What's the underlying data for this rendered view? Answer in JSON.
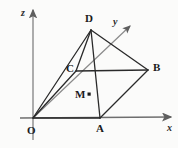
{
  "figure": {
    "kind": "3d-solid-geometry-diagram",
    "width": 178,
    "height": 148,
    "background_color": "#fbfbfa",
    "stroke_color": "#2a2a2a",
    "axis_color": "#6e6e6e"
  },
  "axes": [
    {
      "id": "x",
      "label": "x",
      "label_x": 167,
      "label_y": 124,
      "from_x": 20,
      "from_y": 118,
      "to_x": 171,
      "to_y": 117
    },
    {
      "id": "y",
      "label": "y",
      "label_x": 113,
      "label_y": 18,
      "from_x": 33,
      "from_y": 118,
      "to_x": 130,
      "to_y": 26
    },
    {
      "id": "z",
      "label": "z",
      "label_x": 21,
      "label_y": 8,
      "from_x": 33,
      "from_y": 140,
      "to_x": 33,
      "to_y": 10
    }
  ],
  "vertices": [
    {
      "id": "O",
      "label": "O",
      "x": 33,
      "y": 118,
      "label_x": 27,
      "label_y": 126
    },
    {
      "id": "A",
      "label": "A",
      "x": 100,
      "y": 118,
      "label_x": 96,
      "label_y": 124
    },
    {
      "id": "B",
      "label": "B",
      "x": 148,
      "y": 70,
      "label_x": 153,
      "label_y": 63
    },
    {
      "id": "C",
      "label": "C",
      "x": 76,
      "y": 71,
      "label_x": 67,
      "label_y": 63
    },
    {
      "id": "D",
      "label": "D",
      "x": 91,
      "y": 30,
      "label_x": 86,
      "label_y": 14
    },
    {
      "id": "M",
      "label": "M",
      "x": 89,
      "y": 95,
      "label_x": 76,
      "label_y": 90
    }
  ],
  "edges": [
    {
      "id": "OA",
      "from": "O",
      "to": "A"
    },
    {
      "id": "AB",
      "from": "A",
      "to": "B"
    },
    {
      "id": "BC",
      "from": "B",
      "to": "C"
    },
    {
      "id": "CO",
      "from": "C",
      "to": "O"
    },
    {
      "id": "OD",
      "from": "O",
      "to": "D"
    },
    {
      "id": "AD",
      "from": "A",
      "to": "D"
    },
    {
      "id": "BD",
      "from": "B",
      "to": "D"
    },
    {
      "id": "CD",
      "from": "C",
      "to": "D"
    }
  ],
  "markers": [
    {
      "id": "M-point",
      "x": 89,
      "y": 94,
      "size": 3
    }
  ]
}
